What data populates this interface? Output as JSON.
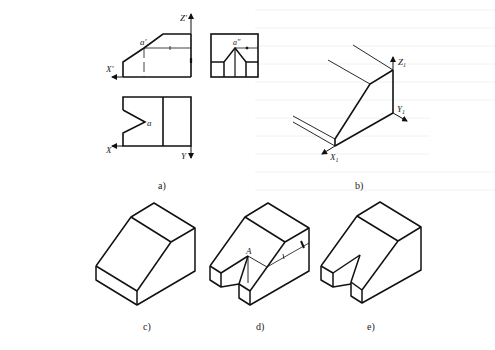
{
  "figure": {
    "subfigures": [
      {
        "id": "a",
        "caption": "a)",
        "description": "Three orthographic views: front view, side view, top view"
      },
      {
        "id": "b",
        "caption": "b)",
        "description": "Isometric axes with projection of front profile"
      },
      {
        "id": "c",
        "caption": "c)",
        "description": "Isometric block before cutting notch"
      },
      {
        "id": "d",
        "caption": "d)",
        "description": "Isometric construction of V-notch with point A"
      },
      {
        "id": "e",
        "caption": "e)",
        "description": "Final isometric drawing"
      }
    ],
    "labels": {
      "front_axis_z": "Z'",
      "front_axis_x": "X'",
      "front_point": "a'",
      "side_point": "a\"",
      "top_point": "a",
      "top_axis_x": "X",
      "top_axis_y": "Y",
      "iso_z": "Z",
      "iso_y": "Y",
      "iso_x": "X",
      "iso_sub": "1",
      "point_A": "A"
    }
  },
  "colors": {
    "line": "#111111",
    "background": "#ffffff",
    "bleed_text": "#e8e8e8"
  }
}
